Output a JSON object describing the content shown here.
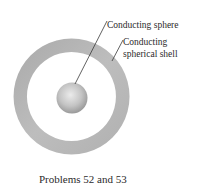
{
  "figure": {
    "labels": {
      "sphere": "Conducting sphere",
      "shell_line1": "Conducting",
      "shell_line2": "spherical shell"
    },
    "caption": "Problems 52 and 53",
    "colors": {
      "shell": "#b4b4b4",
      "sphere_light": "#e6e6e6",
      "sphere_dark": "#9e9e9e",
      "leader": "#3a3a3a"
    }
  }
}
